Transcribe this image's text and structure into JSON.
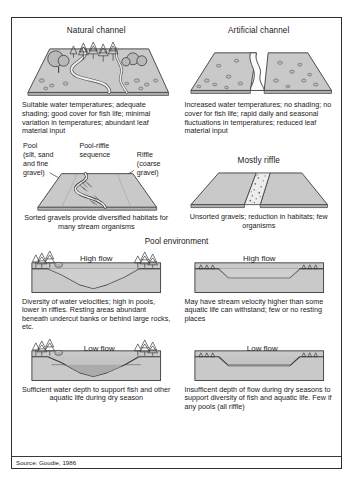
{
  "figure": {
    "source_note": "Source: Goudie, 1986"
  },
  "top": {
    "left": {
      "heading": "Natural channel",
      "caption": "Suitable water temperatures; adequate shading; good cover for fish life; minimal variation in temperatures; abundant leaf material input"
    },
    "right": {
      "heading": "Artificial channel",
      "caption": "Increased water temperatures; no shading; no cover for fish life; rapid daily and seasonal fluctuations in temperatures; reduced leaf material input"
    }
  },
  "middle": {
    "left": {
      "label_pool": "Pool\n(silt, sand\nand fine\ngravel)",
      "label_sequence": "Pool-riffle\nsequence",
      "label_riffle": "Riffle\n(coarse\ngravel)",
      "caption": "Sorted gravels provide diversified habitats for many stream organisms"
    },
    "right": {
      "heading": "Mostly riffle",
      "caption": "Unsorted gravels; reduction in habitats; few organisms"
    }
  },
  "pool_environment": {
    "title": "Pool environment",
    "high_flow_label": "High flow",
    "low_flow_label": "Low flow",
    "left": {
      "high_caption": "Diversity of water velocities; high in pools, lower in riffles. Resting areas abundant beneath undercut banks or behind large rocks, etc.",
      "low_caption": "Sufficient water depth to support fish and other aquatic life during dry season"
    },
    "right": {
      "high_caption": "May have stream velocity higher than some aquatic life can withstand; few or no resting places",
      "low_caption": "Insufficent depth of flow during dry seasons to support diversity of fish and aquatic life. Few if any pools (all riffle)"
    }
  },
  "colors": {
    "land": "#c9c9c9",
    "land_dark": "#b0b0b0",
    "water": "#f2f2f2",
    "outline": "#3a3a3a",
    "text": "#1a1a1a"
  }
}
